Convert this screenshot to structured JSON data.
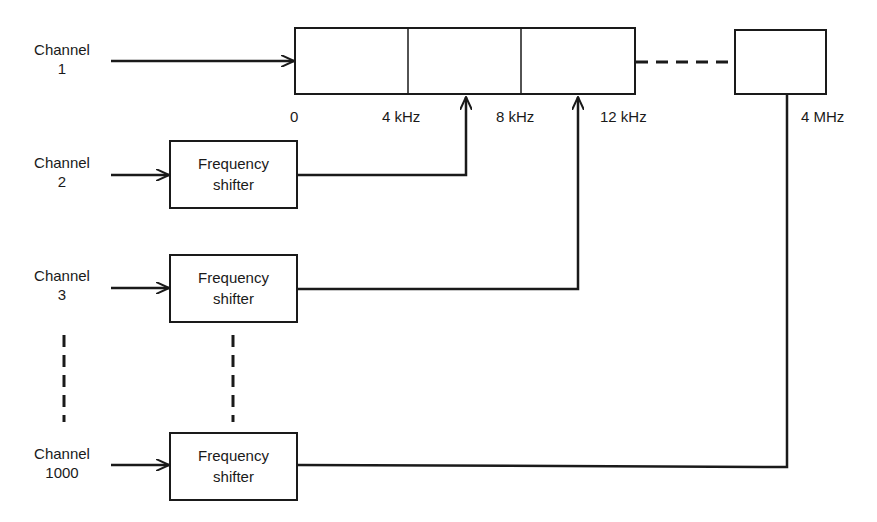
{
  "diagram": {
    "channels": [
      {
        "label_line1": "Channel",
        "label_line2": "1"
      },
      {
        "label_line1": "Channel",
        "label_line2": "2"
      },
      {
        "label_line1": "Channel",
        "label_line2": "3"
      },
      {
        "label_line1": "Channel",
        "label_line2": "1000"
      }
    ],
    "shifter": {
      "line1": "Frequency",
      "line2": "shifter"
    },
    "frequency_ticks": [
      "0",
      "4 kHz",
      "8 kHz",
      "12 kHz",
      "4 MHz"
    ],
    "colors": {
      "stroke": "#1a1a1a",
      "background": "#ffffff"
    }
  }
}
